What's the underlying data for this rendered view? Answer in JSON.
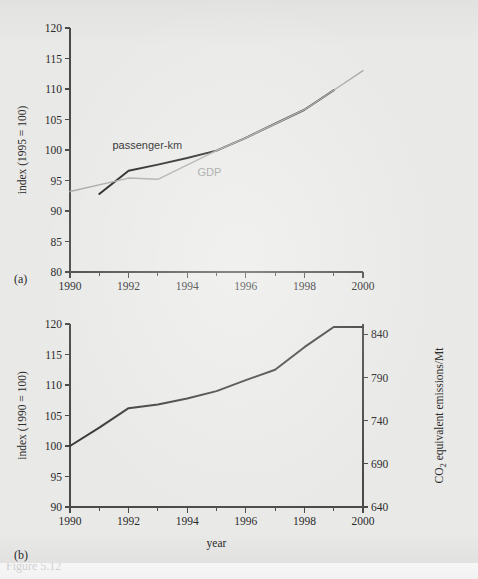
{
  "figure": {
    "background_color": "#e9e9e7",
    "panel_a_letter": "(a)",
    "panel_b_letter": "(b)",
    "caption_remnant": "Figure 5.12"
  },
  "chart_data": [
    {
      "id": "panel-a",
      "type": "line",
      "title": "",
      "xlabel": "",
      "ylabel": "index (1995 = 100)",
      "xlim": [
        1990,
        2000
      ],
      "ylim": [
        80,
        120
      ],
      "xticks": [
        1990,
        1992,
        1994,
        1996,
        1998,
        2000
      ],
      "xtick_labels": [
        "1990",
        "1992",
        "1994",
        "1996",
        "1998",
        "2000"
      ],
      "xminor_ticks": [
        1991,
        1993,
        1995,
        1997,
        1999
      ],
      "yticks": [
        80,
        85,
        90,
        95,
        100,
        105,
        110,
        115,
        120
      ],
      "ytick_labels": [
        "80",
        "85",
        "90",
        "95",
        "100",
        "105",
        "110",
        "115",
        "120"
      ],
      "grid": false,
      "legend": "inline-annotations",
      "series": [
        {
          "name": "passenger-km",
          "color": "#1d1d1d",
          "width": 2.0,
          "label_x": 1991.45,
          "label_y": 100.1,
          "label_anchor": "start",
          "label_style": "dark",
          "x": [
            1991,
            1992,
            1993,
            1994,
            1995,
            1996,
            1997,
            1998,
            1999
          ],
          "y": [
            92.8,
            96.6,
            97.6,
            98.7,
            99.9,
            102.0,
            104.3,
            106.6,
            109.8
          ]
        },
        {
          "name": "GDP",
          "color": "#a9a9a9",
          "width": 1.4,
          "label_x": 1994.35,
          "label_y": 95.7,
          "label_anchor": "start",
          "label_style": "light",
          "x": [
            1990,
            1992,
            1993,
            1995,
            1996,
            1997,
            1998,
            1999,
            2000
          ],
          "y": [
            93.2,
            95.4,
            95.2,
            99.9,
            102.0,
            104.3,
            106.6,
            109.8,
            113.0
          ]
        }
      ]
    },
    {
      "id": "panel-b",
      "type": "line",
      "title": "",
      "xlabel": "year",
      "ylabel": "index (1990 = 100)",
      "ylabel_right": "CO₂ equivalent emissions/Mt",
      "xlim": [
        1990,
        2000
      ],
      "ylim": [
        90,
        120
      ],
      "ylim_right": [
        640,
        852
      ],
      "xticks": [
        1990,
        1992,
        1994,
        1996,
        1998,
        2000
      ],
      "xtick_labels": [
        "1990",
        "1992",
        "1994",
        "1996",
        "1998",
        "2000"
      ],
      "xminor_ticks": [
        1991,
        1993,
        1995,
        1997,
        1999
      ],
      "yticks": [
        90,
        95,
        100,
        105,
        110,
        115,
        120
      ],
      "ytick_labels": [
        "90",
        "95",
        "100",
        "105",
        "110",
        "115",
        "120"
      ],
      "yticks_right": [
        640,
        690,
        740,
        790,
        840
      ],
      "ytick_labels_right": [
        "640",
        "690",
        "740",
        "790",
        "840"
      ],
      "grid": false,
      "series": [
        {
          "name": "CO2 equivalent emissions index",
          "color": "#3a3a3a",
          "width": 2.0,
          "x": [
            1990,
            1991,
            1992,
            1993,
            1994,
            1995,
            1996,
            1997,
            1998,
            1999,
            2000
          ],
          "y": [
            100.0,
            103.0,
            106.2,
            106.8,
            107.8,
            109.0,
            110.8,
            112.5,
            116.2,
            119.5,
            119.5
          ]
        }
      ]
    }
  ]
}
